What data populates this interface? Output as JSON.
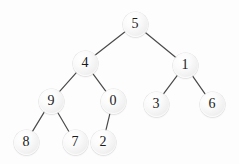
{
  "figure": {
    "kind": "binary-tree-diagram",
    "width": 239,
    "height": 164,
    "background_color": "#fdfdfd",
    "edge_color": "#4a4a4a",
    "node_fill_color": "#f1f1f1",
    "node_text_color": "#1a1a1a",
    "node_radius": 12.5
  },
  "nodes": [
    {
      "id": "n0",
      "label": "5",
      "x": 135,
      "y": 24,
      "level": 0
    },
    {
      "id": "n1",
      "label": "4",
      "x": 85,
      "y": 63,
      "level": 1
    },
    {
      "id": "n2",
      "label": "1",
      "x": 185,
      "y": 65,
      "level": 1
    },
    {
      "id": "n3",
      "label": "9",
      "x": 51,
      "y": 101,
      "level": 2
    },
    {
      "id": "n4",
      "label": "0",
      "x": 113,
      "y": 101,
      "level": 2
    },
    {
      "id": "n5",
      "label": "3",
      "x": 156,
      "y": 104,
      "level": 2
    },
    {
      "id": "n6",
      "label": "6",
      "x": 212,
      "y": 104,
      "level": 2
    },
    {
      "id": "n7",
      "label": "8",
      "x": 26,
      "y": 142,
      "level": 3
    },
    {
      "id": "n8",
      "label": "7",
      "x": 75,
      "y": 142,
      "level": 3
    },
    {
      "id": "n9",
      "label": "2",
      "x": 103,
      "y": 142,
      "level": 3
    }
  ],
  "edges": [
    {
      "id": "e0",
      "from": "n0",
      "to": "n1",
      "x1": 135,
      "y1": 24,
      "x2": 85,
      "y2": 63
    },
    {
      "id": "e1",
      "from": "n0",
      "to": "n2",
      "x1": 135,
      "y1": 24,
      "x2": 185,
      "y2": 65
    },
    {
      "id": "e2",
      "from": "n1",
      "to": "n3",
      "x1": 85,
      "y1": 63,
      "x2": 51,
      "y2": 101
    },
    {
      "id": "e3",
      "from": "n1",
      "to": "n4",
      "x1": 85,
      "y1": 63,
      "x2": 113,
      "y2": 101
    },
    {
      "id": "e4",
      "from": "n2",
      "to": "n5",
      "x1": 185,
      "y1": 65,
      "x2": 156,
      "y2": 104
    },
    {
      "id": "e5",
      "from": "n2",
      "to": "n6",
      "x1": 185,
      "y1": 65,
      "x2": 212,
      "y2": 104
    },
    {
      "id": "e6",
      "from": "n3",
      "to": "n7",
      "x1": 51,
      "y1": 101,
      "x2": 26,
      "y2": 142
    },
    {
      "id": "e7",
      "from": "n3",
      "to": "n8",
      "x1": 51,
      "y1": 101,
      "x2": 75,
      "y2": 142
    },
    {
      "id": "e8",
      "from": "n4",
      "to": "n9",
      "x1": 113,
      "y1": 101,
      "x2": 103,
      "y2": 142
    }
  ]
}
